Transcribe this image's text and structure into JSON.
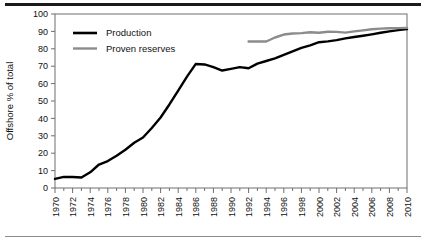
{
  "chart_data": {
    "type": "line",
    "title": "",
    "subtitle": "",
    "xlabel": "",
    "ylabel": "Offshore % of total",
    "xlim": [
      1970,
      2010
    ],
    "ylim": [
      0,
      100
    ],
    "grid": false,
    "legend_position": "top-left",
    "y_ticks": [
      0,
      10,
      20,
      30,
      40,
      50,
      60,
      70,
      80,
      90,
      100
    ],
    "y_tick_labels": [
      "0",
      "10",
      "20",
      "30",
      "40",
      "50",
      "60",
      "70",
      "80",
      "90",
      "100"
    ],
    "x_ticks": [
      1970,
      1972,
      1974,
      1976,
      1978,
      1980,
      1982,
      1984,
      1986,
      1988,
      1990,
      1992,
      1994,
      1996,
      1998,
      2000,
      2002,
      2004,
      2006,
      2008,
      2010
    ],
    "x_tick_labels": [
      "1970",
      "1972",
      "1974",
      "1976",
      "1978",
      "1980",
      "1982",
      "1984",
      "1986",
      "1988",
      "1990",
      "1992",
      "1994",
      "1996",
      "1998",
      "2000",
      "2002",
      "2004",
      "2006",
      "2008",
      "2010"
    ],
    "x_minor_ticks": [
      1971,
      1973,
      1975,
      1977,
      1979,
      1981,
      1983,
      1985,
      1987,
      1989,
      1991,
      1993,
      1995,
      1997,
      1999,
      2001,
      2003,
      2005,
      2007,
      2009
    ],
    "series": [
      {
        "name": "Production",
        "color": "#000000",
        "linewidth": 2.4,
        "x": [
          1970,
          1971,
          1972,
          1973,
          1974,
          1975,
          1976,
          1977,
          1978,
          1979,
          1980,
          1981,
          1982,
          1983,
          1984,
          1985,
          1986,
          1987,
          1988,
          1989,
          1990,
          1991,
          1992,
          1993,
          1994,
          1995,
          1996,
          1997,
          1998,
          1999,
          2000,
          2001,
          2002,
          2003,
          2004,
          2005,
          2006,
          2007,
          2008,
          2009,
          2010
        ],
        "values": [
          5.2,
          6.4,
          6.3,
          6.0,
          9.0,
          13.5,
          15.5,
          18.5,
          22.0,
          26.0,
          29.0,
          34.5,
          40.5,
          48.0,
          56.0,
          64.0,
          71.3,
          71.0,
          69.5,
          67.5,
          68.5,
          69.5,
          68.8,
          71.5,
          73.0,
          74.5,
          76.5,
          78.5,
          80.5,
          82.0,
          83.8,
          84.3,
          85.0,
          86.0,
          86.8,
          87.5,
          88.3,
          89.2,
          90.0,
          90.7,
          91.3
        ]
      },
      {
        "name": "Proven reserves",
        "color": "#8c8c8c",
        "linewidth": 2.4,
        "x": [
          1992,
          1993,
          1994,
          1995,
          1996,
          1997,
          1998,
          1999,
          2000,
          2001,
          2002,
          2003,
          2004,
          2005,
          2006,
          2007,
          2008,
          2009,
          2010
        ],
        "values": [
          84.2,
          84.2,
          84.2,
          86.5,
          88.2,
          88.8,
          89.0,
          89.5,
          89.2,
          89.8,
          89.7,
          89.3,
          90.0,
          90.6,
          91.2,
          91.6,
          91.8,
          91.9,
          92.0
        ]
      }
    ]
  },
  "legend": {
    "items": [
      {
        "label": "Production",
        "color": "#000000"
      },
      {
        "label": "Proven reserves",
        "color": "#8c8c8c"
      }
    ]
  },
  "axes": {
    "y_title": "Offshore % of total"
  }
}
